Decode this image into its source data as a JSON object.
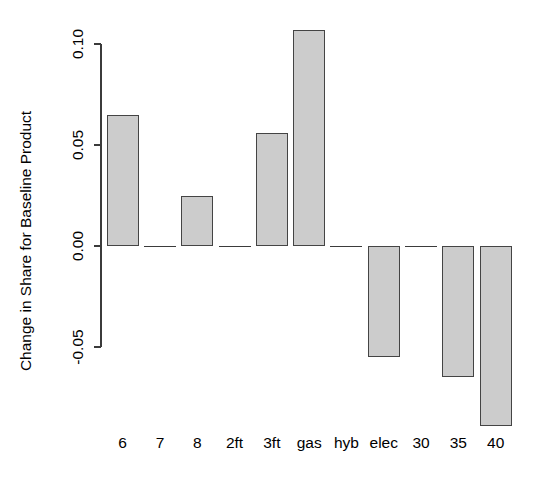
{
  "chart_data": {
    "type": "bar",
    "title": "",
    "xlabel": "",
    "ylabel": "Change in Share for Baseline Product",
    "categories": [
      "6",
      "7",
      "8",
      "2ft",
      "3ft",
      "gas",
      "hyb",
      "elec",
      "30",
      "35",
      "40"
    ],
    "values": [
      0.065,
      0.0,
      0.025,
      0.0,
      0.056,
      0.107,
      0.0,
      -0.055,
      0.0,
      -0.065,
      -0.089
    ],
    "ylim": [
      -0.055,
      0.11
    ],
    "yticks": [
      -0.05,
      0.0,
      0.05,
      0.1
    ],
    "ytick_labels": [
      "-0.05",
      "0.00",
      "0.05",
      "0.10"
    ],
    "grid": false,
    "legend": null,
    "bar_fill_color": "#cccccc",
    "bar_border_color": "#444444",
    "axis_color": "#3b3b3b",
    "background_color": "#ffffff"
  },
  "axis": {
    "y_title": "Change in Share for Baseline Product"
  }
}
